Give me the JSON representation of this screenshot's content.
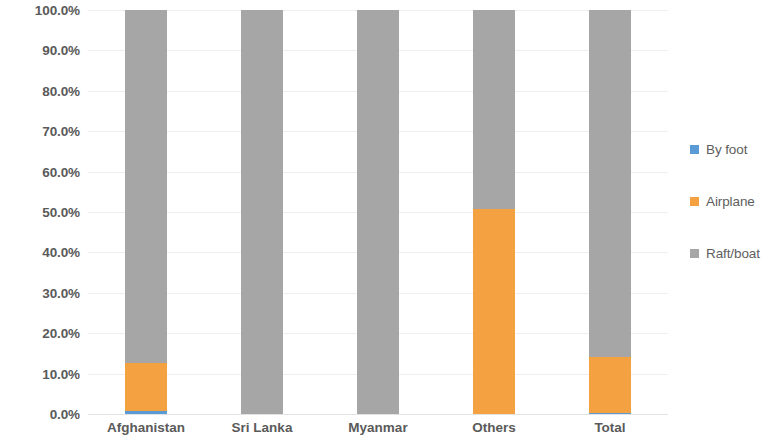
{
  "chart_data": {
    "type": "bar",
    "subtype": "stacked-100-percent",
    "title": "",
    "subtitle": "",
    "xlabel": "",
    "ylabel": "",
    "categories": [
      "Afghanistan",
      "Sri Lanka",
      "Myanmar",
      "Others",
      "Total"
    ],
    "series": [
      {
        "name": "By foot",
        "color": "#5B9BD5",
        "values": [
          0.7,
          0.0,
          0.0,
          0.0,
          0.2
        ]
      },
      {
        "name": "Airplane",
        "color": "#F4A142",
        "values": [
          11.9,
          0.0,
          0.0,
          50.7,
          13.9
        ]
      },
      {
        "name": "Raft/boat",
        "color": "#A6A6A6",
        "values": [
          87.4,
          100.0,
          100.0,
          49.3,
          85.9
        ]
      }
    ],
    "ylim": [
      0,
      100
    ],
    "ytick_labels": [
      "0.0%",
      "10.0%",
      "20.0%",
      "30.0%",
      "40.0%",
      "50.0%",
      "60.0%",
      "70.0%",
      "80.0%",
      "90.0%",
      "100.0%"
    ],
    "ytick_values": [
      0,
      10,
      20,
      30,
      40,
      50,
      60,
      70,
      80,
      90,
      100
    ],
    "grid": true,
    "grid_axis": "y",
    "legend_position": "right",
    "legend_entries": [
      "By foot",
      "Airplane",
      "Raft/boat"
    ],
    "colors": {
      "by_foot": "#5B9BD5",
      "airplane": "#F4A142",
      "raft_boat": "#A6A6A6",
      "gridline": "#efefef",
      "text": "#5a5a5a",
      "background": "#ffffff"
    }
  }
}
